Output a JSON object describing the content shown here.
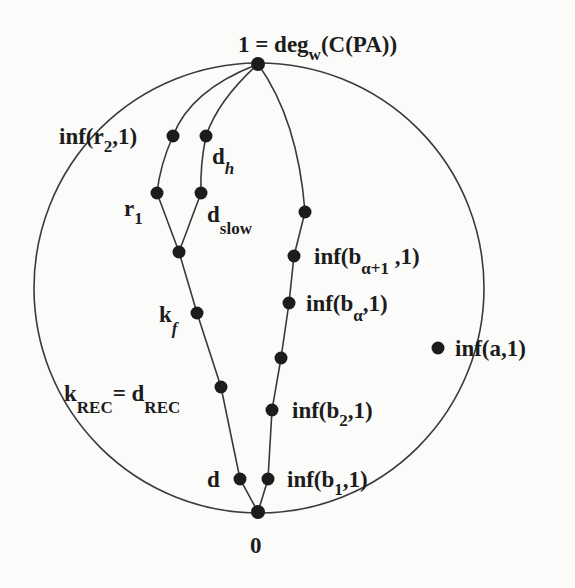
{
  "diagram": {
    "type": "degree-lattice-diagram",
    "circle": {
      "cx": 259,
      "cy": 288,
      "r": 225
    },
    "colors": {
      "ink": "#1c1c1c",
      "edge": "#3a3a3a",
      "background": "#fbfbf9"
    },
    "labels": {
      "top": {
        "main": "1 = deg",
        "sub": "w",
        "tail": "(C(PA))"
      },
      "bottom": "0",
      "inf_r2": {
        "main": "inf(r",
        "sub": "2",
        "tail": ",1)"
      },
      "d_h": {
        "main": "d",
        "sub": "h"
      },
      "r1": {
        "main": "r",
        "sub": "1"
      },
      "d_slow": {
        "main": "d",
        "sub": "slow"
      },
      "k_f": {
        "main": "k",
        "sub": "f"
      },
      "k_rec": {
        "main": "k",
        "sub": "REC",
        "eq": "= d",
        "sub2": "REC"
      },
      "d": "d",
      "inf_b_alpha_plus_1": {
        "main": "inf(b",
        "sub": "α+1",
        "tail": " ,1)"
      },
      "inf_b_alpha": {
        "main": "inf(b",
        "sub": "α",
        "tail": ",1)"
      },
      "inf_b2": {
        "main": "inf(b",
        "sub": "2",
        "tail": ",1)"
      },
      "inf_b1": {
        "main": "inf(b",
        "sub": "1",
        "tail": ",1)"
      },
      "inf_a": "inf(a,1)"
    },
    "nodes": [
      {
        "id": "top",
        "x": 258,
        "y": 64
      },
      {
        "id": "bottom",
        "x": 258,
        "y": 512
      },
      {
        "id": "inf_r2",
        "x": 173,
        "y": 136
      },
      {
        "id": "d_h",
        "x": 206,
        "y": 136
      },
      {
        "id": "r1",
        "x": 157,
        "y": 193
      },
      {
        "id": "d_slow",
        "x": 201,
        "y": 193
      },
      {
        "id": "junction",
        "x": 179,
        "y": 252
      },
      {
        "id": "k_f",
        "x": 197,
        "y": 313
      },
      {
        "id": "k_rec",
        "x": 221,
        "y": 387
      },
      {
        "id": "d",
        "x": 240,
        "y": 479
      },
      {
        "id": "b_top",
        "x": 305,
        "y": 212
      },
      {
        "id": "b_alpha_plus_1",
        "x": 294,
        "y": 256
      },
      {
        "id": "b_alpha",
        "x": 289,
        "y": 303
      },
      {
        "id": "b_mid",
        "x": 281,
        "y": 358
      },
      {
        "id": "b2",
        "x": 272,
        "y": 410
      },
      {
        "id": "b1",
        "x": 268,
        "y": 479
      },
      {
        "id": "inf_a",
        "x": 438,
        "y": 348
      }
    ]
  }
}
